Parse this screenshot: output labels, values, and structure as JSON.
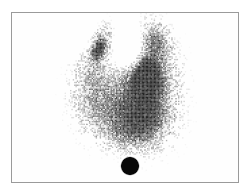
{
  "image": {
    "kind": "thyroid-scintigram",
    "width": 249,
    "height": 196,
    "background_color": "#ffffff",
    "modality_note": "grayscale planar nuclear-medicine count map"
  },
  "frame": {
    "x": 11,
    "y": 12,
    "width": 228,
    "height": 171,
    "border_color": "#9a9a9a",
    "border_width": 1,
    "fill_color": "#fefefe"
  },
  "chart_data": {
    "type": "heatmap",
    "title": "",
    "xlabel": "",
    "ylabel": "",
    "colormap": "grayscale-inverted",
    "colormap_min_color": "#ffffff",
    "colormap_max_color": "#000000",
    "xlim": [
      0,
      228
    ],
    "ylim": [
      0,
      171
    ],
    "grid": false,
    "legend": false,
    "noise": {
      "type": "poisson-speckle",
      "pixel_size": 1.35,
      "seed": 20240517,
      "threshold_scale": 1.0
    },
    "regions": [
      {
        "name": "right-lobe-superior-pole",
        "cx": 88,
        "cy": 28,
        "rx": 13,
        "ry": 18,
        "rot_deg": 18,
        "intensity": 0.52
      },
      {
        "name": "right-lobe-body",
        "cx": 80,
        "cy": 62,
        "rx": 19,
        "ry": 32,
        "rot_deg": 8,
        "intensity": 0.46
      },
      {
        "name": "right-lobe-inferior",
        "cx": 86,
        "cy": 95,
        "rx": 22,
        "ry": 26,
        "rot_deg": -6,
        "intensity": 0.42
      },
      {
        "name": "right-lobe-focal-hot-spot",
        "cx": 86,
        "cy": 36,
        "rx": 6,
        "ry": 11,
        "rot_deg": 20,
        "intensity": 0.8
      },
      {
        "name": "left-lobe-superior-pole",
        "cx": 143,
        "cy": 26,
        "rx": 13,
        "ry": 18,
        "rot_deg": -16,
        "intensity": 0.6
      },
      {
        "name": "left-lobe-body",
        "cx": 140,
        "cy": 60,
        "rx": 23,
        "ry": 34,
        "rot_deg": -6,
        "intensity": 0.72
      },
      {
        "name": "left-lobe-dominant-nodule",
        "cx": 133,
        "cy": 62,
        "rx": 14,
        "ry": 18,
        "rot_deg": 0,
        "intensity": 0.95
      },
      {
        "name": "left-lobe-inferior",
        "cx": 137,
        "cy": 100,
        "rx": 24,
        "ry": 30,
        "rot_deg": 4,
        "intensity": 0.72
      },
      {
        "name": "isthmus",
        "cx": 114,
        "cy": 78,
        "rx": 22,
        "ry": 28,
        "rot_deg": 0,
        "intensity": 0.58
      },
      {
        "name": "inferior-confluence",
        "cx": 117,
        "cy": 110,
        "rx": 30,
        "ry": 22,
        "rot_deg": 0,
        "intensity": 0.55
      },
      {
        "name": "inferior-tail-fade",
        "cx": 116,
        "cy": 124,
        "rx": 24,
        "ry": 12,
        "rot_deg": 0,
        "intensity": 0.3
      }
    ],
    "cold_regions": [
      {
        "name": "suprasternal-notch-gap",
        "cx": 116,
        "cy": 36,
        "rx": 14,
        "ry": 20,
        "rot_deg": 0,
        "strength": 0.92
      },
      {
        "name": "upper-left-background",
        "cx": 62,
        "cy": 20,
        "rx": 22,
        "ry": 18,
        "rot_deg": 0,
        "strength": 0.5
      }
    ],
    "markers": [
      {
        "name": "sternal-notch-reference-marker",
        "shape": "filled-circle",
        "cx": 118,
        "cy": 153,
        "radius": 8.5,
        "color": "#080808",
        "edge_softness": 1.6
      }
    ]
  }
}
